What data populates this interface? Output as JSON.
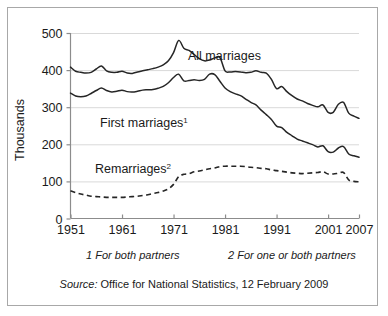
{
  "chart_data": {
    "type": "line",
    "title": "",
    "xlabel": "",
    "ylabel": "Thousands",
    "xlim": [
      1951,
      2007
    ],
    "ylim": [
      0,
      500
    ],
    "yticks": [
      0,
      100,
      200,
      300,
      400,
      500
    ],
    "xticks": [
      1951,
      1961,
      1971,
      1981,
      1991,
      2001,
      2007
    ],
    "grid": "horizontal",
    "legend_position": "inline-annotations",
    "x": [
      1951,
      1952,
      1953,
      1954,
      1955,
      1956,
      1957,
      1958,
      1959,
      1960,
      1961,
      1962,
      1963,
      1964,
      1965,
      1966,
      1967,
      1968,
      1969,
      1970,
      1971,
      1972,
      1973,
      1974,
      1975,
      1976,
      1977,
      1978,
      1979,
      1980,
      1981,
      1982,
      1983,
      1984,
      1985,
      1986,
      1987,
      1988,
      1989,
      1990,
      1991,
      1992,
      1993,
      1994,
      1995,
      1996,
      1997,
      1998,
      1999,
      2000,
      2001,
      2002,
      2003,
      2004,
      2005,
      2006,
      2007
    ],
    "series": [
      {
        "name": "All marriages",
        "style": "solid",
        "color": "#262626",
        "values": [
          408,
          397,
          394,
          392,
          394,
          403,
          411,
          398,
          394,
          394,
          397,
          392,
          391,
          395,
          398,
          401,
          404,
          408,
          414,
          425,
          447,
          480,
          459,
          453,
          442,
          431,
          425,
          427,
          433,
          434,
          398,
          395,
          396,
          395,
          393,
          394,
          398,
          394,
          392,
          375,
          350,
          356,
          342,
          331,
          322,
          317,
          310,
          305,
          301,
          306,
          286,
          286,
          308,
          313,
          284,
          276,
          270
        ]
      },
      {
        "name": "First marriages",
        "style": "solid",
        "color": "#262626",
        "values": [
          338,
          330,
          328,
          330,
          337,
          345,
          352,
          345,
          341,
          343,
          346,
          342,
          341,
          343,
          346,
          347,
          348,
          351,
          356,
          366,
          380,
          389,
          371,
          372,
          374,
          372,
          375,
          389,
          388,
          370,
          352,
          342,
          336,
          331,
          322,
          313,
          306,
          292,
          280,
          267,
          249,
          245,
          232,
          223,
          214,
          209,
          204,
          199,
          193,
          196,
          180,
          179,
          190,
          194,
          174,
          169,
          165
        ]
      },
      {
        "name": "Remarriages",
        "style": "dashed",
        "color": "#262626",
        "values": [
          75,
          70,
          66,
          63,
          60,
          59,
          58,
          57,
          57,
          57,
          57,
          58,
          59,
          60,
          62,
          64,
          67,
          70,
          74,
          80,
          92,
          113,
          119,
          121,
          126,
          128,
          131,
          134,
          136,
          140,
          141,
          141,
          141,
          141,
          140,
          138,
          137,
          135,
          134,
          131,
          129,
          127,
          125,
          123,
          122,
          121,
          122,
          123,
          124,
          126,
          120,
          120,
          122,
          124,
          104,
          100,
          99
        ]
      }
    ],
    "annotations": [
      {
        "name": "all-marriages-label",
        "text": "All marriages",
        "x": 1978,
        "y": 456
      },
      {
        "name": "first-marriages-label",
        "text": "First marriages",
        "superscript": "1",
        "x": 1962,
        "y": 236
      },
      {
        "name": "remarriages-label",
        "text": "Remarriages",
        "superscript": "2",
        "x": 1959,
        "y": 144
      }
    ]
  },
  "axes": {
    "y_axis_title": "Thousands",
    "y_tick_labels": [
      "500",
      "400",
      "300",
      "200",
      "100",
      "0"
    ],
    "x_tick_labels": [
      "1951",
      "1961",
      "1971",
      "1981",
      "1991",
      "2001",
      "2007"
    ]
  },
  "footnotes": {
    "note1": "1 For both partners",
    "note2": "2 For one or both partners"
  },
  "source": {
    "lead": "Source:",
    "text": " Office for National Statistics, 12 February 2009"
  },
  "labels": {
    "all_marriages": "All marriages",
    "first_marriages": "First marriages",
    "first_marriages_sup": "1",
    "remarriages": "Remarriages",
    "remarriages_sup": "2"
  },
  "colors": {
    "line": "#262626",
    "grid": "#d9d9d9",
    "axis": "#8c8c8c",
    "frame": "#a8a8a8",
    "background": "#ffffff"
  }
}
